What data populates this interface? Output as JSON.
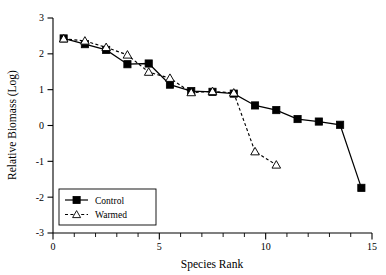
{
  "chart_data": {
    "type": "line",
    "title": "",
    "xlabel": "Species Rank",
    "ylabel": "Relative Biomass (Log)",
    "xlim": [
      0,
      15
    ],
    "ylim": [
      -3,
      3
    ],
    "xticks": [
      0,
      5,
      10,
      15
    ],
    "xtick_labels": [
      "0",
      "5",
      "10",
      "15"
    ],
    "xminor_ticks": [
      1,
      2,
      3,
      4,
      6,
      7,
      8,
      9,
      11,
      12,
      13,
      14
    ],
    "yticks": [
      -3,
      -2,
      -1,
      0,
      1,
      2,
      3
    ],
    "ytick_labels": [
      "-3",
      "-2",
      "-1",
      "0",
      "1",
      "2",
      "3"
    ],
    "grid": false,
    "legend_position": "lower-left",
    "series": [
      {
        "name": "Control",
        "marker": "filled-square",
        "line_style": "solid",
        "color": "#000000",
        "x": [
          0.5,
          1.5,
          2.5,
          3.5,
          4.5,
          5.5,
          6.5,
          7.5,
          8.5,
          9.5,
          10.5,
          11.5,
          12.5,
          13.5,
          14.5
        ],
        "y": [
          2.43,
          2.27,
          2.11,
          1.71,
          1.73,
          1.14,
          0.96,
          0.94,
          0.89,
          0.56,
          0.43,
          0.18,
          0.11,
          0.02,
          -1.74
        ]
      },
      {
        "name": "Warmed",
        "marker": "open-triangle",
        "line_style": "dashed",
        "color": "#000000",
        "x": [
          0.5,
          1.5,
          2.5,
          3.5,
          4.5,
          5.5,
          6.5,
          7.5,
          8.5,
          9.5,
          10.5
        ],
        "y": [
          2.42,
          2.36,
          2.18,
          1.97,
          1.49,
          1.32,
          0.92,
          0.95,
          0.91,
          -0.73,
          -1.1
        ]
      }
    ]
  },
  "legend": {
    "entries": [
      {
        "label": "Control"
      },
      {
        "label": "Warmed"
      }
    ]
  }
}
